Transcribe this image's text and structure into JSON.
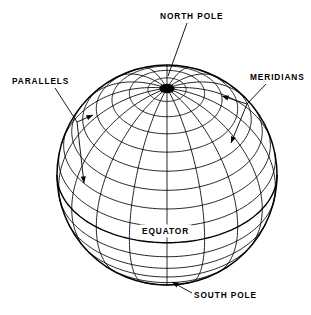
{
  "figure": {
    "background_color": "#ffffff",
    "line_color": "#000000"
  },
  "labels": {
    "north_pole": "NORTH POLE",
    "south_pole": "SOUTH POLE",
    "equator": "EQUATOR",
    "parallels": "PARALLELS",
    "meridians": "MERIDIANS"
  },
  "chart_data": {
    "type": "diagram",
    "sphere": {
      "center_x": 167,
      "center_y": 175,
      "radius": 110,
      "view_latitude_deg": 38,
      "north_pole_px": [
        167,
        77
      ],
      "south_pole_px": [
        172,
        283
      ]
    },
    "parallels": {
      "count": 17,
      "spacing_deg": 10,
      "latitudes_deg": [
        80,
        70,
        60,
        50,
        40,
        30,
        20,
        10,
        0,
        -10,
        -20,
        -30,
        -40,
        -50,
        -60,
        -70,
        -80
      ],
      "equator_latitude_deg": 0
    },
    "meridians": {
      "count": 18,
      "spacing_deg": 20,
      "longitudes_deg": [
        0,
        20,
        40,
        60,
        80,
        100,
        120,
        140,
        160,
        180,
        200,
        220,
        240,
        260,
        280,
        300,
        320,
        340
      ]
    },
    "annotations": [
      {
        "text": "NORTH POLE",
        "text_px": [
          160,
          19
        ],
        "arrow_to_px": [
          167,
          77
        ]
      },
      {
        "text": "PARALLELS",
        "text_px": [
          12,
          84
        ],
        "arrow_to_px": [
          79,
          122
        ]
      },
      {
        "text": "PARALLELS",
        "text_px": [
          12,
          84
        ],
        "arrow_to_px": [
          83,
          184
        ]
      },
      {
        "text": "MERIDIANS",
        "text_px": [
          250,
          80
        ],
        "arrow_to_px": [
          240,
          101
        ]
      },
      {
        "text": "MERIDIANS",
        "text_px": [
          250,
          80
        ],
        "arrow_to_px": [
          231,
          142
        ]
      },
      {
        "text": "EQUATOR",
        "text_px": [
          142,
          234
        ],
        "arrow_to_px": null
      },
      {
        "text": "SOUTH POLE",
        "text_px": [
          194,
          298
        ],
        "arrow_to_px": [
          172,
          283
        ]
      }
    ]
  }
}
